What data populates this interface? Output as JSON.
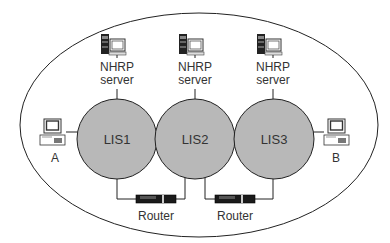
{
  "diagram": {
    "type": "network",
    "boundary": {
      "shape": "ellipse",
      "cx": 199,
      "cy": 125,
      "rx": 179,
      "ry": 112,
      "stroke": "#222222"
    },
    "colors": {
      "lis_fill": "#b8b8b8",
      "line": "#222222",
      "router_body": "#1a1a1a",
      "background": "#ffffff"
    },
    "subnets": [
      {
        "id": "LIS1",
        "label": "LIS1",
        "cx": 117,
        "cy": 139,
        "r": 40
      },
      {
        "id": "LIS2",
        "label": "LIS2",
        "cx": 195,
        "cy": 139,
        "r": 40
      },
      {
        "id": "LIS3",
        "label": "LIS3",
        "cx": 274,
        "cy": 139,
        "r": 40
      }
    ],
    "servers": [
      {
        "line1": "NHRP",
        "line2": "server",
        "x": 117,
        "attached_to": "LIS1"
      },
      {
        "line1": "NHRP",
        "line2": "server",
        "x": 195,
        "attached_to": "LIS2"
      },
      {
        "line1": "NHRP",
        "line2": "server",
        "x": 273,
        "attached_to": "LIS3"
      }
    ],
    "hosts": [
      {
        "label": "A",
        "attached_to": "LIS1"
      },
      {
        "label": "B",
        "attached_to": "LIS3"
      }
    ],
    "routers": [
      {
        "label": "Router",
        "connects": [
          "LIS1",
          "LIS2"
        ]
      },
      {
        "label": "Router",
        "connects": [
          "LIS2",
          "LIS3"
        ]
      }
    ]
  }
}
